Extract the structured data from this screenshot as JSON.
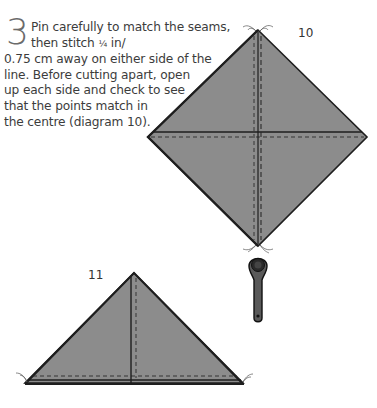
{
  "instruction": {
    "step_number": "3",
    "lines": [
      "Pin carefully to match the seams,",
      "then stitch ",
      "0.75 cm away on either side of the",
      "line. Before cutting apart, open",
      "up each side and check to see",
      "that the points match in",
      "the centre (diagram 10)."
    ],
    "fraction": "¼",
    "unit_suffix": " in/"
  },
  "diagrams": [
    {
      "label": "10",
      "description": "square quilt block on point with cross seams and dashed stitching lines"
    },
    {
      "label": "11",
      "description": "half-square triangle with vertical seam and dashed stitching line"
    }
  ],
  "tool": {
    "icon": "rotary-cutter-icon"
  },
  "colors": {
    "fabric": "#8c8c8c",
    "outline": "#1e1e1e",
    "stitch": "#2a2a2a",
    "text": "#3c3c3c",
    "step_number": "#6b6b6b"
  }
}
